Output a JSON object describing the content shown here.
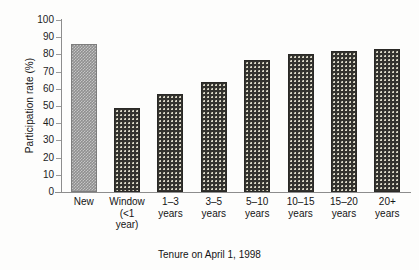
{
  "chart_data": {
    "type": "bar",
    "title": "",
    "xlabel": "Tenure on April 1, 1998",
    "ylabel": "Participation rate (%)",
    "ylim": [
      0,
      100
    ],
    "ytick_step": 10,
    "ytick_labels": [
      "100",
      "90",
      "80",
      "70",
      "60",
      "50",
      "40",
      "30",
      "20",
      "10",
      "0"
    ],
    "grid": false,
    "legend": "none",
    "categories": [
      "New",
      "Window (<1 year)",
      "1–3 years",
      "3–5 years",
      "5–10 years",
      "10–15 years",
      "15–20 years",
      "20+ years"
    ],
    "category_lines": [
      [
        "New"
      ],
      [
        "Window",
        "(<1",
        "year)"
      ],
      [
        "1–3",
        "years"
      ],
      [
        "3–5",
        "years"
      ],
      [
        "5–10",
        "years"
      ],
      [
        "10–15",
        "years"
      ],
      [
        "15–20",
        "years"
      ],
      [
        "20+",
        "years"
      ]
    ],
    "values": [
      86,
      49,
      57,
      64,
      77,
      80,
      82,
      83
    ],
    "bar_styles": [
      "gray",
      "dark",
      "dark",
      "dark",
      "dark",
      "dark",
      "dark",
      "dark"
    ],
    "colors": {
      "bar_gray": "#8f8f8f",
      "bar_dark": "#33322e",
      "axis": "#8d8d8d",
      "text": "#141414",
      "background": "#fdfdfc"
    }
  }
}
